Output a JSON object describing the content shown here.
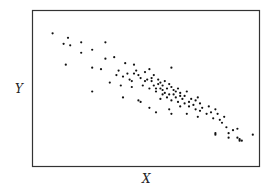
{
  "chart_data": {
    "type": "scatter",
    "title": "",
    "xlabel": "X",
    "ylabel": "Y",
    "grid": false,
    "legend": null,
    "xlim": [
      0,
      100
    ],
    "ylim": [
      0,
      100
    ],
    "ticks": "none",
    "points": [
      [
        8,
        87
      ],
      [
        13,
        80
      ],
      [
        15,
        84
      ],
      [
        16,
        79
      ],
      [
        21,
        81
      ],
      [
        21,
        74
      ],
      [
        14,
        66
      ],
      [
        26,
        76
      ],
      [
        32,
        81
      ],
      [
        26,
        64
      ],
      [
        32,
        70
      ],
      [
        30,
        63
      ],
      [
        36,
        71
      ],
      [
        37,
        59
      ],
      [
        40,
        58
      ],
      [
        38,
        62
      ],
      [
        41,
        67
      ],
      [
        42,
        60
      ],
      [
        43,
        56
      ],
      [
        44,
        55
      ],
      [
        45,
        60
      ],
      [
        47,
        59
      ],
      [
        44,
        51
      ],
      [
        45,
        66
      ],
      [
        46,
        62
      ],
      [
        48,
        57
      ],
      [
        49,
        52
      ],
      [
        50,
        55
      ],
      [
        50,
        61
      ],
      [
        51,
        56
      ],
      [
        52,
        50
      ],
      [
        52,
        63
      ],
      [
        53,
        55
      ],
      [
        53,
        57
      ],
      [
        54,
        59
      ],
      [
        54,
        52
      ],
      [
        55,
        50
      ],
      [
        55,
        48
      ],
      [
        56,
        53
      ],
      [
        56,
        56
      ],
      [
        57,
        50
      ],
      [
        57,
        54
      ],
      [
        58,
        46
      ],
      [
        58,
        49
      ],
      [
        58,
        52
      ],
      [
        59,
        55
      ],
      [
        59,
        47
      ],
      [
        60,
        50
      ],
      [
        60,
        44
      ],
      [
        61,
        46
      ],
      [
        61,
        53
      ],
      [
        62,
        51
      ],
      [
        62,
        42
      ],
      [
        63,
        49
      ],
      [
        63,
        46
      ],
      [
        64,
        44
      ],
      [
        64,
        48
      ],
      [
        65,
        41
      ],
      [
        65,
        50
      ],
      [
        66,
        45
      ],
      [
        66,
        47
      ],
      [
        67,
        43
      ],
      [
        68,
        40
      ],
      [
        68,
        45
      ],
      [
        69,
        48
      ],
      [
        70,
        38
      ],
      [
        70,
        41
      ],
      [
        71,
        43
      ],
      [
        72,
        39
      ],
      [
        73,
        36
      ],
      [
        73,
        42
      ],
      [
        74,
        44
      ],
      [
        75,
        35
      ],
      [
        75,
        40
      ],
      [
        76,
        37
      ],
      [
        78,
        33
      ],
      [
        79,
        38
      ],
      [
        80,
        34
      ],
      [
        81,
        30
      ],
      [
        82,
        36
      ],
      [
        83,
        33
      ],
      [
        84,
        29
      ],
      [
        85,
        27
      ],
      [
        86,
        31
      ],
      [
        87,
        24
      ],
      [
        88,
        20
      ],
      [
        90,
        22
      ],
      [
        92,
        17
      ],
      [
        92,
        23
      ],
      [
        93,
        16
      ],
      [
        99,
        19
      ],
      [
        40,
        44
      ],
      [
        47,
        42
      ],
      [
        48,
        41
      ],
      [
        52,
        37
      ],
      [
        55,
        34
      ],
      [
        61,
        36
      ],
      [
        62,
        33
      ],
      [
        26,
        48
      ],
      [
        34,
        54
      ],
      [
        39,
        52
      ],
      [
        57,
        43
      ],
      [
        66,
        38
      ],
      [
        69,
        33
      ],
      [
        74,
        31
      ],
      [
        82,
        19
      ],
      [
        82,
        20
      ],
      [
        88,
        17
      ],
      [
        93,
        15
      ],
      [
        94,
        15
      ],
      [
        62,
        64
      ]
    ]
  }
}
